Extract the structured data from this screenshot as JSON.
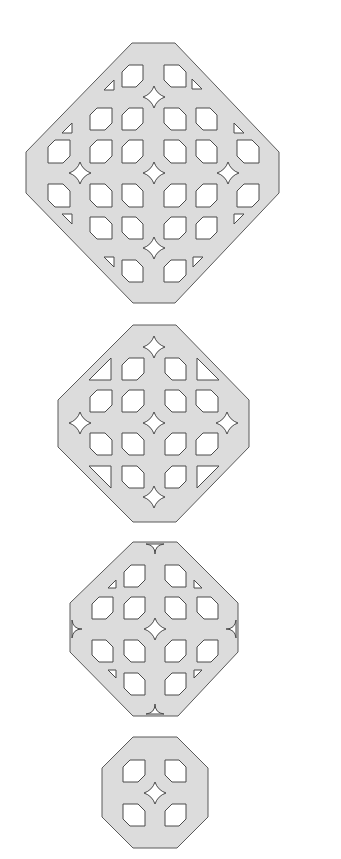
{
  "figure": {
    "colors": {
      "fill": "#dcdcdc",
      "stroke": "#5a5a5a",
      "hole": "#ffffff",
      "background": "#ffffff"
    }
  },
  "shapes": [
    {
      "name": "large-lattice-octagon",
      "octagon": [
        [
          132,
          43
        ],
        [
          175,
          43
        ],
        [
          279,
          152
        ],
        [
          279,
          193
        ],
        [
          175,
          303
        ],
        [
          133,
          303
        ],
        [
          26,
          193
        ],
        [
          26,
          152
        ]
      ],
      "hole_cols": [
        [
          48,
          70
        ],
        [
          90,
          112
        ],
        [
          122,
          143
        ],
        [
          164,
          186
        ],
        [
          196,
          217
        ],
        [
          237,
          259
        ]
      ],
      "hole_rows": [
        [
          65,
          87
        ],
        [
          108,
          130
        ],
        [
          140,
          163
        ],
        [
          184,
          207
        ],
        [
          217,
          239
        ],
        [
          260,
          282
        ]
      ],
      "hole_layout": [
        [
          2,
          3
        ],
        [
          1,
          2,
          3,
          4
        ],
        [
          0,
          1,
          2,
          3,
          4,
          5
        ],
        [
          0,
          1,
          2,
          3,
          4,
          5
        ],
        [
          1,
          2,
          3,
          4
        ],
        [
          2,
          3
        ]
      ],
      "stars": [
        [
          154,
          97
        ],
        [
          80,
          173
        ],
        [
          154,
          173
        ],
        [
          228,
          173
        ],
        [
          154,
          248
        ]
      ],
      "star_size": 11,
      "triangles": [
        [
          109,
          85,
          "tl"
        ],
        [
          197,
          84,
          "tr"
        ],
        [
          67,
          128,
          "tl"
        ],
        [
          239,
          128,
          "tr"
        ],
        [
          67,
          219,
          "bl"
        ],
        [
          239,
          219,
          "br"
        ],
        [
          109,
          262,
          "bl"
        ],
        [
          198,
          262,
          "br"
        ]
      ],
      "triangle_size": 5,
      "notches": []
    },
    {
      "name": "medium-lattice-octagon",
      "octagon": [
        [
          133,
          325
        ],
        [
          176,
          325
        ],
        [
          249,
          400
        ],
        [
          249,
          447
        ],
        [
          176,
          522
        ],
        [
          133,
          522
        ],
        [
          58,
          447
        ],
        [
          58,
          400
        ]
      ],
      "hole_cols": [
        [
          90,
          112
        ],
        [
          122,
          144
        ],
        [
          165,
          186
        ],
        [
          196,
          218
        ]
      ],
      "hole_rows": [
        [
          358,
          380
        ],
        [
          390,
          412
        ],
        [
          433,
          455
        ],
        [
          466,
          488
        ]
      ],
      "hole_layout": [
        [
          1,
          2
        ],
        [
          0,
          1,
          2,
          3
        ],
        [
          0,
          1,
          2,
          3
        ],
        [
          1,
          2
        ]
      ],
      "stars": [
        [
          154,
          347
        ],
        [
          80,
          423
        ],
        [
          154,
          423
        ],
        [
          227,
          423
        ],
        [
          154,
          497
        ]
      ],
      "star_size": 11,
      "triangles": [
        [
          100,
          369,
          "tl-big"
        ],
        [
          208,
          369,
          "tr-big"
        ],
        [
          100,
          477,
          "bl-big"
        ],
        [
          208,
          477,
          "br-big"
        ]
      ],
      "triangle_size": 11,
      "notches": []
    },
    {
      "name": "small-lattice-octagon",
      "octagon": [
        [
          133,
          542
        ],
        [
          177,
          542
        ],
        [
          238,
          603
        ],
        [
          238,
          652
        ],
        [
          178,
          716
        ],
        [
          133,
          716
        ],
        [
          70,
          652
        ],
        [
          70,
          603
        ]
      ],
      "hole_cols": [
        [
          92,
          113
        ],
        [
          124,
          145
        ],
        [
          165,
          186
        ],
        [
          197,
          218
        ]
      ],
      "hole_rows": [
        [
          565,
          587
        ],
        [
          597,
          619
        ],
        [
          640,
          662
        ],
        [
          673,
          695
        ]
      ],
      "hole_layout": [
        [
          1,
          2
        ],
        [
          0,
          1,
          2,
          3
        ],
        [
          0,
          1,
          2,
          3
        ],
        [
          1,
          2
        ]
      ],
      "stars": [
        [
          155,
          629
        ]
      ],
      "star_size": 11,
      "triangles": [
        [
          112,
          584,
          "tl"
        ],
        [
          198,
          584,
          "tr"
        ],
        [
          112,
          674,
          "bl"
        ],
        [
          198,
          674,
          "br"
        ]
      ],
      "triangle_size": 4,
      "notches": [
        [
          155,
          542,
          "top"
        ],
        [
          155,
          716,
          "bottom"
        ],
        [
          70,
          629,
          "left"
        ],
        [
          238,
          629,
          "right"
        ]
      ]
    },
    {
      "name": "tiny-lattice-octagon",
      "octagon": [
        [
          133,
          737
        ],
        [
          177,
          737
        ],
        [
          208,
          768
        ],
        [
          208,
          817
        ],
        [
          177,
          848
        ],
        [
          133,
          848
        ],
        [
          102,
          817
        ],
        [
          102,
          768
        ]
      ],
      "hole_cols": [
        [
          123,
          145
        ],
        [
          165,
          186
        ]
      ],
      "hole_rows": [
        [
          760,
          782
        ],
        [
          804,
          826
        ]
      ],
      "hole_layout": [
        [
          0,
          1
        ],
        [
          0,
          1
        ]
      ],
      "stars": [
        [
          155,
          793
        ]
      ],
      "star_size": 11,
      "triangles": [],
      "triangle_size": 0,
      "notches": []
    }
  ]
}
